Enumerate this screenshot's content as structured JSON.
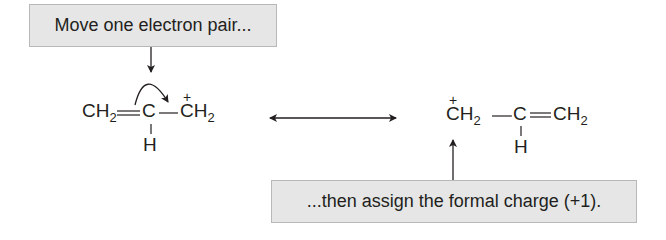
{
  "callouts": {
    "top": "Move one electron pair...",
    "bottom": "...then assign the formal charge (+1)."
  },
  "structure_left": {
    "atoms": {
      "ch2_left": "CH",
      "ch2_left_sub": "2",
      "c_center": "C",
      "h_center": "H",
      "ch2_right": "CH",
      "ch2_right_sub": "2",
      "charge": "+"
    },
    "bonds": [
      "double: CH2=C",
      "single: C-CH2",
      "single: C-H"
    ],
    "curved_arrow": "from C=C double bond to C-CH2+ bond"
  },
  "resonance_arrow": "double-headed",
  "structure_right": {
    "atoms": {
      "ch2_left": "CH",
      "ch2_left_sub": "2",
      "c_center": "C",
      "h_center": "H",
      "ch2_right": "CH",
      "ch2_right_sub": "2",
      "charge": "+"
    },
    "bonds": [
      "single: CH2-C",
      "double: C=CH2",
      "single: C-H"
    ]
  },
  "colors": {
    "callout_bg": "#e6e6e6",
    "callout_border": "#b8b8b8",
    "ink": "#231f20"
  }
}
